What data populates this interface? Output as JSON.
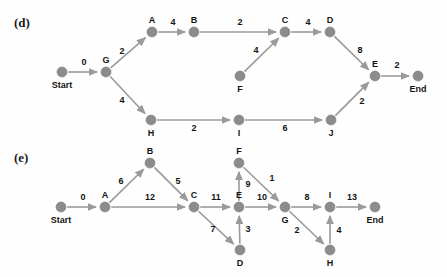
{
  "figure": {
    "panels": [
      {
        "id": "d",
        "label": "(d)",
        "label_pos": {
          "x": 14,
          "y": 27
        },
        "nodes": [
          {
            "id": "Start",
            "label": "Start",
            "x": 62,
            "y": 72,
            "label_dx": 0,
            "label_dy": 16,
            "terminal": true
          },
          {
            "id": "G",
            "label": "G",
            "x": 106,
            "y": 72,
            "label_dx": 0,
            "label_dy": -9,
            "terminal": false
          },
          {
            "id": "A",
            "label": "A",
            "x": 152,
            "y": 32,
            "label_dx": 0,
            "label_dy": -9,
            "terminal": false
          },
          {
            "id": "B",
            "label": "B",
            "x": 194,
            "y": 32,
            "label_dx": 0,
            "label_dy": -9,
            "terminal": false
          },
          {
            "id": "C",
            "label": "C",
            "x": 285,
            "y": 32,
            "label_dx": 0,
            "label_dy": -9,
            "terminal": false
          },
          {
            "id": "D",
            "label": "D",
            "x": 330,
            "y": 32,
            "label_dx": 0,
            "label_dy": -9,
            "terminal": false
          },
          {
            "id": "F",
            "label": "F",
            "x": 240,
            "y": 76,
            "label_dx": 0,
            "label_dy": 16,
            "terminal": false
          },
          {
            "id": "E",
            "label": "E",
            "x": 375,
            "y": 76,
            "label_dx": 0,
            "label_dy": -9,
            "terminal": false
          },
          {
            "id": "End",
            "label": "End",
            "x": 418,
            "y": 76,
            "label_dx": 0,
            "label_dy": 16,
            "terminal": true
          },
          {
            "id": "H",
            "label": "H",
            "x": 151,
            "y": 120,
            "label_dx": 0,
            "label_dy": 16,
            "terminal": false
          },
          {
            "id": "I",
            "label": "I",
            "x": 239,
            "y": 120,
            "label_dx": 0,
            "label_dy": 16,
            "terminal": false
          },
          {
            "id": "J",
            "label": "J",
            "x": 331,
            "y": 120,
            "label_dx": 0,
            "label_dy": 16,
            "terminal": false
          }
        ],
        "edges": [
          {
            "from": "Start",
            "to": "G",
            "weight": "0",
            "wx": 84,
            "wy": 65
          },
          {
            "from": "G",
            "to": "A",
            "weight": "2",
            "wx": 122,
            "wy": 54
          },
          {
            "from": "A",
            "to": "B",
            "weight": "4",
            "wx": 173,
            "wy": 25
          },
          {
            "from": "B",
            "to": "C",
            "weight": "2",
            "wx": 240,
            "wy": 25
          },
          {
            "from": "F",
            "to": "C",
            "weight": "4",
            "wx": 256,
            "wy": 53
          },
          {
            "from": "C",
            "to": "D",
            "weight": "4",
            "wx": 308,
            "wy": 25
          },
          {
            "from": "D",
            "to": "E",
            "weight": "8",
            "wx": 360,
            "wy": 53
          },
          {
            "from": "E",
            "to": "End",
            "weight": "2",
            "wx": 397,
            "wy": 68
          },
          {
            "from": "G",
            "to": "H",
            "weight": "4",
            "wx": 122,
            "wy": 103
          },
          {
            "from": "H",
            "to": "I",
            "weight": "2",
            "wx": 194,
            "wy": 131
          },
          {
            "from": "I",
            "to": "J",
            "weight": "6",
            "wx": 285,
            "wy": 131
          },
          {
            "from": "J",
            "to": "E",
            "weight": "2",
            "wx": 362,
            "wy": 104
          }
        ]
      },
      {
        "id": "e",
        "label": "(e)",
        "label_pos": {
          "x": 14,
          "y": 162
        },
        "nodes": [
          {
            "id": "Start",
            "label": "Start",
            "x": 61,
            "y": 207,
            "label_dx": 0,
            "label_dy": 16,
            "terminal": true
          },
          {
            "id": "A",
            "label": "A",
            "x": 105,
            "y": 207,
            "label_dx": 0,
            "label_dy": -9,
            "terminal": false
          },
          {
            "id": "B",
            "label": "B",
            "x": 150,
            "y": 163,
            "label_dx": 0,
            "label_dy": -9,
            "terminal": false
          },
          {
            "id": "C",
            "label": "C",
            "x": 194,
            "y": 207,
            "label_dx": 0,
            "label_dy": -9,
            "terminal": false
          },
          {
            "id": "E",
            "label": "E",
            "x": 239,
            "y": 207,
            "label_dx": 0,
            "label_dy": -9,
            "terminal": false
          },
          {
            "id": "F",
            "label": "F",
            "x": 239,
            "y": 163,
            "label_dx": 0,
            "label_dy": -9,
            "terminal": false
          },
          {
            "id": "D",
            "label": "D",
            "x": 240,
            "y": 250,
            "label_dx": 0,
            "label_dy": 16,
            "terminal": false
          },
          {
            "id": "G",
            "label": "G",
            "x": 285,
            "y": 207,
            "label_dx": 0,
            "label_dy": 16,
            "terminal": false
          },
          {
            "id": "H",
            "label": "H",
            "x": 330,
            "y": 250,
            "label_dx": 0,
            "label_dy": 16,
            "terminal": false
          },
          {
            "id": "I",
            "label": "I",
            "x": 330,
            "y": 207,
            "label_dx": 0,
            "label_dy": -9,
            "terminal": false
          },
          {
            "id": "End",
            "label": "End",
            "x": 375,
            "y": 207,
            "label_dx": 0,
            "label_dy": 16,
            "terminal": true
          }
        ],
        "edges": [
          {
            "from": "Start",
            "to": "A",
            "weight": "0",
            "wx": 83,
            "wy": 200
          },
          {
            "from": "A",
            "to": "B",
            "weight": "6",
            "wx": 121,
            "wy": 184
          },
          {
            "from": "B",
            "to": "C",
            "weight": "5",
            "wx": 178,
            "wy": 184
          },
          {
            "from": "A",
            "to": "C",
            "weight": "12",
            "wx": 150,
            "wy": 200
          },
          {
            "from": "C",
            "to": "E",
            "weight": "11",
            "wx": 216,
            "wy": 200
          },
          {
            "from": "C",
            "to": "D",
            "weight": "7",
            "wx": 213,
            "wy": 232
          },
          {
            "from": "D",
            "to": "E",
            "weight": "3",
            "wx": 248,
            "wy": 232
          },
          {
            "from": "E",
            "to": "F",
            "weight": "9",
            "wx": 248,
            "wy": 187
          },
          {
            "from": "E",
            "to": "G",
            "weight": "10",
            "wx": 262,
            "wy": 200
          },
          {
            "from": "F",
            "to": "G",
            "weight": "1",
            "wx": 272,
            "wy": 181
          },
          {
            "from": "G",
            "to": "I",
            "weight": "8",
            "wx": 307,
            "wy": 200
          },
          {
            "from": "G",
            "to": "H",
            "weight": "2",
            "wx": 297,
            "wy": 233
          },
          {
            "from": "H",
            "to": "I",
            "weight": "4",
            "wx": 339,
            "wy": 233
          },
          {
            "from": "I",
            "to": "End",
            "weight": "13",
            "wx": 352,
            "wy": 200
          }
        ]
      }
    ],
    "style": {
      "node_radius": 5,
      "node_color": "#8c8c8c",
      "edge_color": "#9a9a9a",
      "text_color": "#141414",
      "background": "#fefefe"
    }
  }
}
